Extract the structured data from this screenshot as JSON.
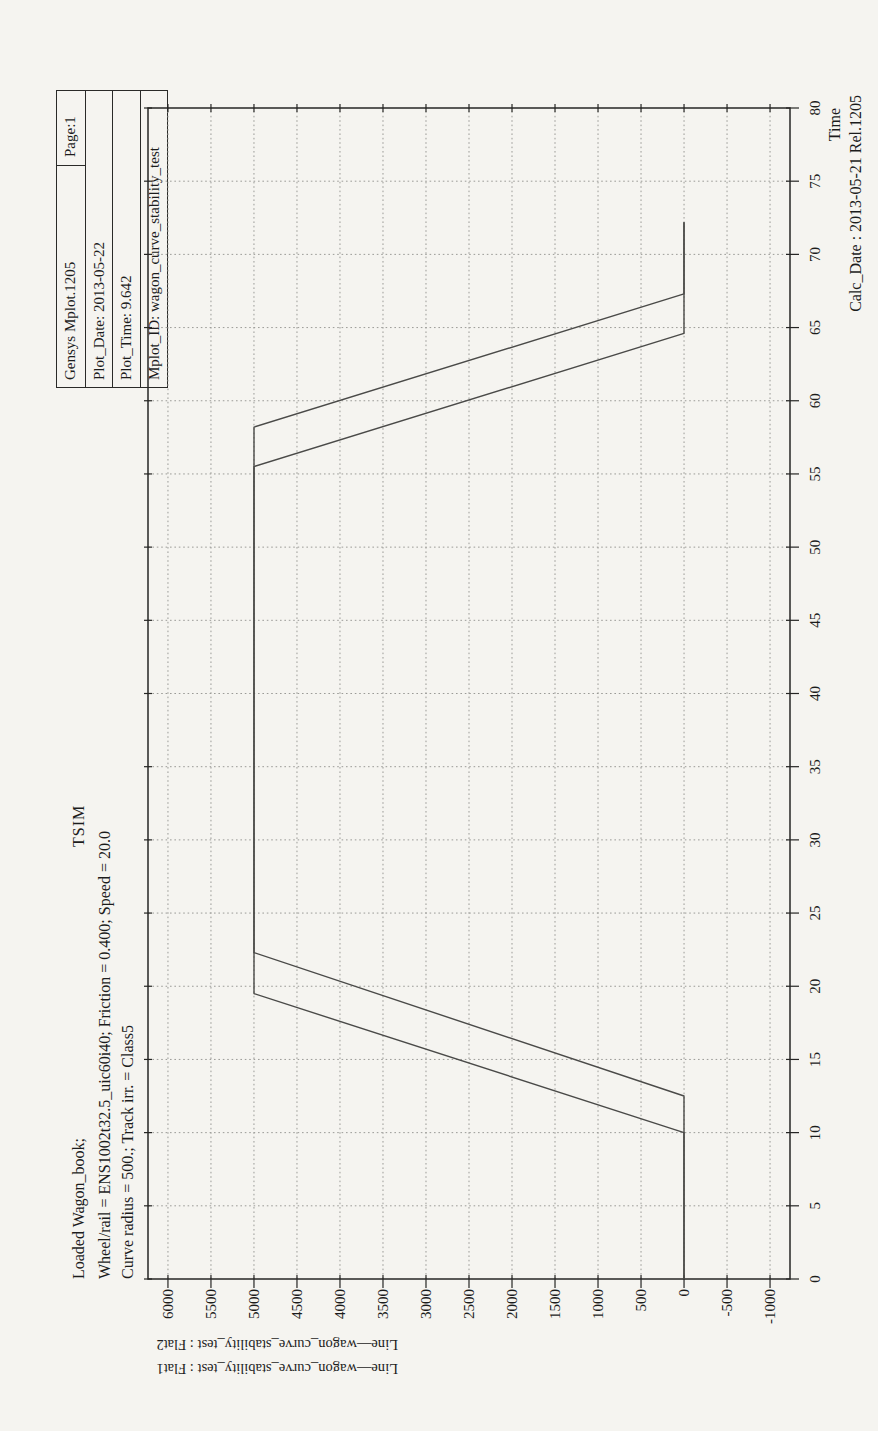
{
  "page": {
    "background": "#f5f4f0",
    "orientation": "landscape plot rotated -90deg on portrait sheet"
  },
  "header_box": {
    "program": "Gensys Mplot.1205",
    "page_label": "Page:1",
    "rows": [
      "Plot_Date: 2013-05-22",
      "Plot_Time: 9.642",
      "Mplot_ID: wagon_curve_stability_test"
    ]
  },
  "titles": {
    "line1": "Loaded Wagon_book;",
    "tsim": "TSIM",
    "line2": "Wheel/rail = ENS1002t32.5_uic60i40; Friction = 0.400; Speed = 20.0",
    "line3": "Curve radius = 500.; Track irr. = Class5"
  },
  "channel_labels": {
    "inner": "Line—wagon_curve_stability_test : Flat2",
    "outer": "Line—wagon_curve_stability_test : Flat1"
  },
  "footer": {
    "time_label": "Time",
    "calc_date": "Calc_Date : 2013-05-21 Rel.1205"
  },
  "chart_data": {
    "type": "line",
    "title": "TSIM",
    "xlabel": "Time",
    "ylabel": "",
    "xlim": [
      0,
      80
    ],
    "ylim": [
      -1232,
      6232
    ],
    "x_ticks": [
      0,
      5,
      10,
      15,
      20,
      25,
      30,
      35,
      40,
      45,
      50,
      55,
      60,
      65,
      70,
      75,
      80
    ],
    "y_ticks": [
      6000,
      5500,
      5000,
      4500,
      4000,
      3500,
      3000,
      2500,
      2000,
      1500,
      1000,
      500,
      0,
      -500,
      -1000
    ],
    "grid": true,
    "grid_style": "dotted",
    "legend_position": "left-rotated",
    "series": [
      {
        "name": "Line—wagon_curve_stability_test : Flat1",
        "points": [
          [
            0,
            0
          ],
          [
            10,
            0
          ],
          [
            19.5,
            5000
          ],
          [
            55.5,
            5000
          ],
          [
            64.6,
            0
          ],
          [
            72.2,
            0
          ]
        ]
      },
      {
        "name": "Line—wagon_curve_stability_test : Flat2",
        "points": [
          [
            0,
            0
          ],
          [
            12.5,
            0
          ],
          [
            22.3,
            5000
          ],
          [
            58.2,
            5000
          ],
          [
            67.3,
            0
          ],
          [
            72.2,
            0
          ]
        ]
      }
    ],
    "colors": {
      "line": "#4a4a48",
      "grid": "#9b9b97",
      "frame": "#262624",
      "text": "#1c1c1c"
    }
  }
}
